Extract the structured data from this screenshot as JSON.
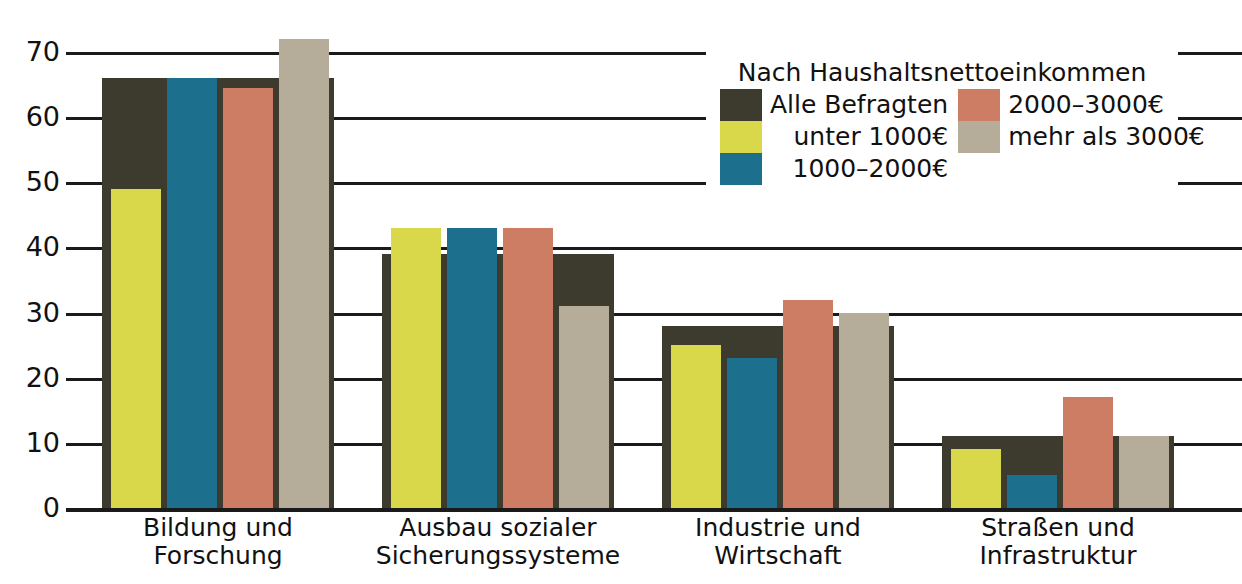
{
  "chart_data": {
    "type": "bar",
    "title": "",
    "subtitle": "",
    "xlabel": "",
    "ylabel": "",
    "ylim": [
      0,
      70
    ],
    "yticks": [
      0,
      10,
      20,
      30,
      40,
      50,
      60,
      70
    ],
    "grid": true,
    "legend_position": "top-right",
    "categories": [
      "Bildung und\nForschung",
      "Ausbau sozialer\nSicherungssysteme",
      "Industrie und\nWirtschaft",
      "Straßen und\nInfrastruktur"
    ],
    "series": [
      {
        "name": "Alle Befragten",
        "color": "#3d3a2e",
        "values": [
          66,
          39,
          28,
          11
        ]
      },
      {
        "name": "unter 1000€",
        "color": "#d8d84a",
        "values": [
          49,
          43,
          25,
          9
        ]
      },
      {
        "name": "1000–2000€",
        "color": "#1d6f8e",
        "values": [
          66,
          43,
          23,
          5
        ]
      },
      {
        "name": "2000–3000€",
        "color": "#cc7d63",
        "values": [
          64.5,
          43,
          32,
          17
        ]
      },
      {
        "name": "mehr als 3000€",
        "color": "#b5ad99",
        "values": [
          72,
          31,
          30,
          11
        ]
      }
    ]
  },
  "legend": {
    "title": "Nach Haushaltsnettoeinkommen",
    "column1": [
      {
        "label": "Alle Befragten",
        "color": "#3d3a2e"
      },
      {
        "label": "unter 1000€",
        "color": "#d8d84a"
      },
      {
        "label": "1000–2000€",
        "color": "#1d6f8e"
      }
    ],
    "column2": [
      {
        "label": "2000–3000€",
        "color": "#cc7d63"
      },
      {
        "label": "mehr als 3000€",
        "color": "#b5ad99"
      }
    ]
  },
  "axis": {
    "ytick_labels": [
      "70",
      "60",
      "50",
      "40",
      "30",
      "20",
      "10",
      "0"
    ]
  }
}
